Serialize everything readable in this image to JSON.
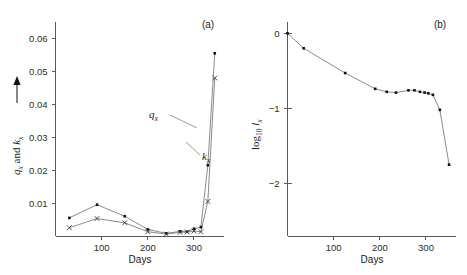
{
  "figure": {
    "background": "#ffffff",
    "line_color": "#6d6d6d",
    "marker_color": "#111111",
    "axis_color": "#5a5a5a"
  },
  "panels": [
    {
      "tag": "(a)",
      "xlabel": "Days",
      "ylabel_parts": {
        "q": "q",
        "qsub": "x",
        "and": " and ",
        "k": "k",
        "ksub": "x"
      },
      "ylabel_plain": "qx and kx",
      "series_label_q": {
        "symbol": "q",
        "sub": "x"
      },
      "series_label_k": {
        "symbol": "k",
        "sub": "x"
      },
      "xticks": [
        100,
        200,
        300
      ],
      "xticklabels": [
        "100",
        "200",
        "300"
      ],
      "yticks": [
        0.01,
        0.02,
        0.03,
        0.04,
        0.05,
        0.06
      ],
      "yticklabels": [
        "0.01",
        "0.02",
        "0.03",
        "0.04",
        "0.05",
        "0.06"
      ]
    },
    {
      "tag": "(b)",
      "xlabel": "Days",
      "ylabel_parts": {
        "log": "log",
        "logsub": "10",
        "l": "l",
        "lsub": "x"
      },
      "ylabel_plain": "log10 lx",
      "xticks": [
        100,
        200,
        300
      ],
      "xticklabels": [
        "100",
        "200",
        "300"
      ],
      "yticks": [
        0,
        -1,
        -2
      ],
      "yticklabels": [
        "0",
        "−1",
        "−2"
      ]
    }
  ],
  "chart_data": [
    {
      "type": "line",
      "title": "(a)",
      "xlabel": "Days",
      "ylabel": "qx and kx",
      "xlim": [
        0,
        365
      ],
      "ylim": [
        0,
        0.065
      ],
      "grid": false,
      "legend": "inline-labels",
      "x": [
        30,
        90,
        150,
        200,
        240,
        270,
        285,
        300,
        315,
        330,
        345
      ],
      "series": [
        {
          "name": "qx",
          "marker": "dot",
          "values": [
            0.0055,
            0.0095,
            0.006,
            0.002,
            0.0008,
            0.0014,
            0.0013,
            0.0022,
            0.0027,
            0.0215,
            0.0555
          ]
        },
        {
          "name": "kx",
          "marker": "cross",
          "values": [
            0.0025,
            0.0053,
            0.004,
            0.0013,
            0.0006,
            0.0011,
            0.0012,
            0.0015,
            0.0013,
            0.0105,
            0.048
          ]
        }
      ]
    },
    {
      "type": "line",
      "title": "(b)",
      "xlabel": "Days",
      "ylabel": "log10 lx",
      "xlim": [
        0,
        365
      ],
      "ylim": [
        -2.7,
        0.15
      ],
      "grid": false,
      "marker": "dot",
      "x": [
        0,
        35,
        125,
        190,
        215,
        235,
        262,
        275,
        287,
        297,
        305,
        315,
        330,
        350
      ],
      "values": [
        0.0,
        -0.2,
        -0.53,
        -0.74,
        -0.78,
        -0.79,
        -0.76,
        -0.76,
        -0.78,
        -0.79,
        -0.8,
        -0.82,
        -1.02,
        -1.75
      ]
    }
  ]
}
